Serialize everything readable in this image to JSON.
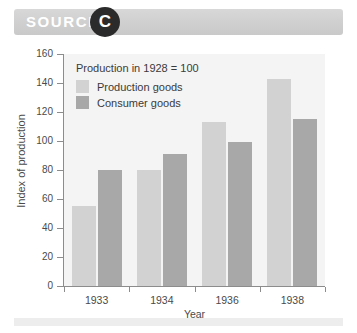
{
  "header": {
    "source_label": "SOURCE",
    "badge_letter": "C"
  },
  "colors": {
    "production_goods": "#d2d2d2",
    "consumer_goods": "#a8a8a8",
    "banner": "#cfcfcf",
    "badge": "#2b2b2b",
    "plot_background": "#f4f4f4",
    "axis": "#8c8c8c"
  },
  "chart_data": {
    "type": "bar",
    "title": "",
    "subtitle": "",
    "annotation": "Production in 1928 = 100",
    "xlabel": "Year",
    "ylabel": "Index of production",
    "categories": [
      "1933",
      "1934",
      "1936",
      "1938"
    ],
    "series": [
      {
        "name": "Production goods",
        "color": "#d2d2d2",
        "values": [
          55,
          80,
          113,
          143
        ]
      },
      {
        "name": "Consumer goods",
        "color": "#a8a8a8",
        "values": [
          80,
          91,
          99,
          115
        ]
      }
    ],
    "ylim": [
      0,
      160
    ],
    "ytick_step": 20,
    "yticks": [
      0,
      20,
      40,
      60,
      80,
      100,
      120,
      140,
      160
    ],
    "grid": false,
    "legend_position": "top-left"
  }
}
